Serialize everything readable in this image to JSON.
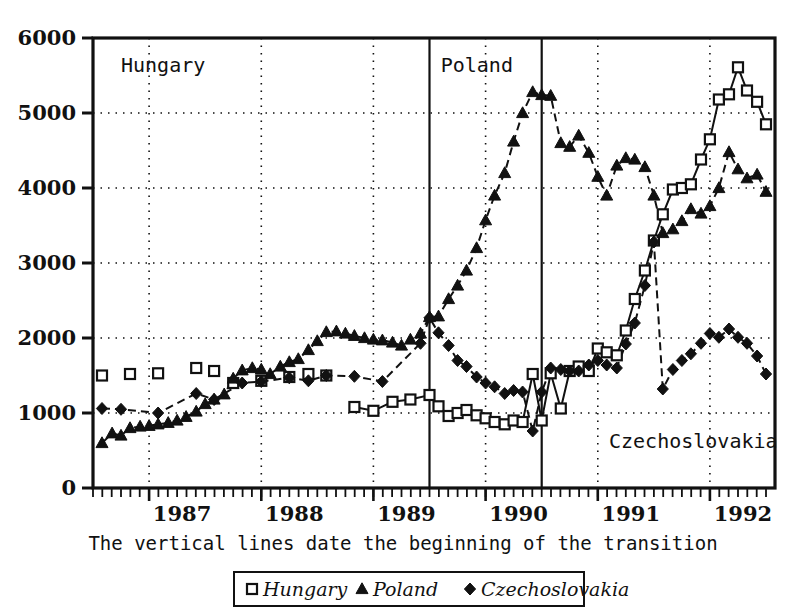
{
  "figure": {
    "caption": "The vertical lines date the beginning of the transition",
    "annotations": [
      {
        "name": "hungary",
        "text": "Hungary"
      },
      {
        "name": "poland",
        "text": "Poland"
      },
      {
        "name": "czechoslovakia",
        "text": "Czechoslovakia"
      }
    ]
  },
  "chart_data": {
    "type": "line",
    "title": "",
    "xlabel": "",
    "ylabel": "",
    "xlim": [
      1986.5,
      1992.58
    ],
    "ylim": [
      0,
      6000
    ],
    "grid": "dotted horizontal gridlines at every 1000; dotted vertical gridlines at each year tick",
    "legend_position": "below-plot-centered",
    "y_ticks": [
      0,
      1000,
      2000,
      3000,
      4000,
      5000,
      6000
    ],
    "y_tick_labels": [
      "0",
      "1000",
      "2000",
      "3000",
      "4000",
      "5000",
      "6000"
    ],
    "x_ticks": [
      1987,
      1988,
      1989,
      1990,
      1991,
      1992
    ],
    "x_tick_labels": [
      "1987",
      "1988",
      "1989",
      "1990",
      "1991",
      "1992"
    ],
    "x_minor_ticks": "monthly",
    "annotations": [
      {
        "label": "Hungary",
        "x": 1986.75,
        "y": 5550
      },
      {
        "label": "Poland",
        "x": 1989.6,
        "y": 5550
      },
      {
        "label": "Czechoslovakia",
        "x": 1991.1,
        "y": 530
      }
    ],
    "vertical_lines": [
      {
        "label": "transition start (Poland)",
        "x": 1989.5
      },
      {
        "label": "transition start (Czechoslovakia / Hungary)",
        "x": 1990.5
      }
    ],
    "series": [
      {
        "name": "Hungary",
        "marker": "open-square",
        "line": "solid",
        "x": [
          1986.58,
          1986.83,
          1987.08,
          1987.42,
          1987.58,
          1987.75,
          1988.0,
          1988.25,
          1988.42,
          1988.58,
          1988.83,
          1989.0,
          1989.17,
          1989.33,
          1989.5,
          1989.58,
          1989.67,
          1989.75,
          1989.83,
          1989.92,
          1990.0,
          1990.08,
          1990.17,
          1990.25,
          1990.33,
          1990.42,
          1990.5,
          1990.58,
          1990.67,
          1990.75,
          1990.83,
          1990.92,
          1991.0,
          1991.08,
          1991.17,
          1991.25,
          1991.33,
          1991.42,
          1991.5,
          1991.58,
          1991.67,
          1991.75,
          1991.83,
          1991.92,
          1992.0,
          1992.08,
          1992.17,
          1992.25,
          1992.33,
          1992.42,
          1992.5
        ],
        "y": [
          1500,
          1520,
          1530,
          1600,
          1560,
          1400,
          1430,
          1480,
          1520,
          1500,
          1080,
          1030,
          1150,
          1180,
          1240,
          1090,
          960,
          1000,
          1040,
          970,
          930,
          880,
          850,
          900,
          880,
          1520,
          900,
          1530,
          1060,
          1560,
          1620,
          1560,
          1860,
          1810,
          1770,
          2100,
          2520,
          2900,
          3300,
          3650,
          3980,
          4000,
          4050,
          4380,
          4650,
          5180,
          5250,
          5610,
          5300,
          5150,
          4850
        ]
      },
      {
        "name": "Poland",
        "marker": "filled-triangle",
        "line": "dashed",
        "x": [
          1986.58,
          1986.67,
          1986.75,
          1986.83,
          1986.92,
          1987.0,
          1987.08,
          1987.17,
          1987.25,
          1987.33,
          1987.42,
          1987.5,
          1987.58,
          1987.67,
          1987.75,
          1987.83,
          1987.92,
          1988.0,
          1988.08,
          1988.17,
          1988.25,
          1988.33,
          1988.42,
          1988.5,
          1988.58,
          1988.67,
          1988.75,
          1988.83,
          1988.92,
          1989.0,
          1989.08,
          1989.17,
          1989.25,
          1989.33,
          1989.42,
          1989.5,
          1989.58,
          1989.67,
          1989.75,
          1989.83,
          1989.92,
          1990.0,
          1990.08,
          1990.17,
          1990.25,
          1990.33,
          1990.42,
          1990.5,
          1990.58,
          1990.67,
          1990.75,
          1990.83,
          1990.92,
          1991.0,
          1991.08,
          1991.17,
          1991.25,
          1991.33,
          1991.42,
          1991.5,
          1991.58,
          1991.67,
          1991.75,
          1991.83,
          1991.92,
          1992.0,
          1992.08,
          1992.17,
          1992.25,
          1992.33,
          1992.42,
          1992.5
        ],
        "y": [
          600,
          730,
          700,
          800,
          820,
          830,
          850,
          870,
          900,
          950,
          1020,
          1120,
          1180,
          1250,
          1460,
          1570,
          1600,
          1580,
          1520,
          1620,
          1680,
          1720,
          1840,
          1960,
          2080,
          2090,
          2060,
          2030,
          2000,
          1980,
          1970,
          1940,
          1900,
          1980,
          2060,
          2280,
          2290,
          2520,
          2700,
          2900,
          3200,
          3570,
          3900,
          4200,
          4620,
          5000,
          5280,
          5240,
          5230,
          4600,
          4550,
          4700,
          4470,
          4150,
          3900,
          4300,
          4400,
          4380,
          4280,
          3900,
          3400,
          3450,
          3560,
          3720,
          3660,
          3760,
          4000,
          4480,
          4250,
          4130,
          4180,
          3950
        ]
      },
      {
        "name": "Czechoslovakia",
        "marker": "filled-diamond",
        "line": "dashed",
        "x": [
          1986.58,
          1986.75,
          1987.08,
          1987.42,
          1987.58,
          1987.83,
          1988.0,
          1988.25,
          1988.42,
          1988.58,
          1988.83,
          1989.08,
          1989.42,
          1989.5,
          1989.58,
          1989.67,
          1989.75,
          1989.83,
          1989.92,
          1990.0,
          1990.08,
          1990.17,
          1990.25,
          1990.33,
          1990.42,
          1990.5,
          1990.58,
          1990.67,
          1990.75,
          1990.83,
          1990.92,
          1991.0,
          1991.08,
          1991.17,
          1991.25,
          1991.33,
          1991.42,
          1991.5,
          1991.58,
          1991.67,
          1991.75,
          1991.83,
          1991.92,
          1992.0,
          1992.08,
          1992.17,
          1992.25,
          1992.33,
          1992.42,
          1992.5
        ],
        "y": [
          1060,
          1050,
          1000,
          1260,
          1180,
          1400,
          1420,
          1470,
          1430,
          1500,
          1490,
          1420,
          1930,
          2270,
          2070,
          1900,
          1700,
          1620,
          1480,
          1400,
          1350,
          1260,
          1300,
          1280,
          760,
          1280,
          1600,
          1580,
          1560,
          1560,
          1640,
          1700,
          1640,
          1600,
          1920,
          2200,
          2700,
          3280,
          1320,
          1580,
          1700,
          1790,
          1930,
          2060,
          2010,
          2120,
          2010,
          1930,
          1760,
          1520
        ]
      }
    ]
  },
  "legend": {
    "items": [
      {
        "label": "Hungary",
        "marker": "open-square"
      },
      {
        "label": "Poland",
        "marker": "filled-triangle"
      },
      {
        "label": "Czechoslovakia",
        "marker": "filled-diamond"
      }
    ]
  }
}
